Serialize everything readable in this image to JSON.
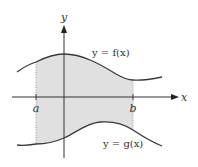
{
  "diagram": {
    "axes": {
      "x_label": "x",
      "y_label": "y"
    },
    "bounds": {
      "a_label": "a",
      "b_label": "b"
    },
    "curves": {
      "upper": {
        "label": "y = f(x)",
        "name": "f"
      },
      "lower": {
        "label": "y = g(x)",
        "name": "g"
      }
    },
    "colors": {
      "region_fill": "#e0e0e0",
      "curve_stroke": "#3a3a3a",
      "axis_stroke": "#333333",
      "boundary_dots": "#8a8a8a"
    }
  }
}
